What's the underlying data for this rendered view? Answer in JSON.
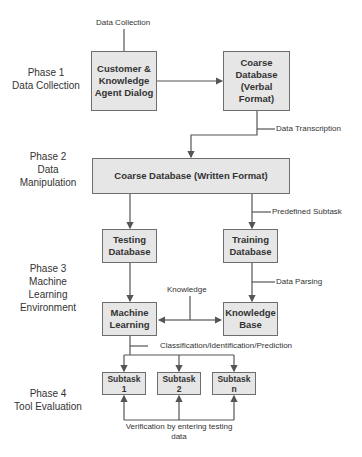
{
  "phases": [
    {
      "id": "phase1",
      "label": "Phase 1\nData Collection"
    },
    {
      "id": "phase2",
      "label": "Phase 2\nData\nManipulation"
    },
    {
      "id": "phase3",
      "label": "Phase 3\nMachine\nLearning\nEnvironment"
    },
    {
      "id": "phase4",
      "label": "Phase 4\nTool Evaluation"
    }
  ],
  "boxes": {
    "dialog": "Customer &\nKnowledge\nAgent Dialog",
    "coarse_verbal": "Coarse\nDatabase\n(Verbal\nFormat)",
    "coarse_written": "Coarse Database (Written Format)",
    "testing_db": "Testing\nDatabase",
    "training_db": "Training\nDatabase",
    "machine_learning": "Machine\nLearning",
    "knowledge_base": "Knowledge\nBase",
    "subtask_1": "Subtask\n1",
    "subtask_2": "Subtask\n2",
    "subtask_n": "Subtask\nn"
  },
  "edge_labels": {
    "data_collection": "Data Collection",
    "data_transcription": "Data Transcription",
    "predefined_subtask": "Predefined Subtask",
    "data_parsing": "Data Parsing",
    "knowledge": "Knowledge",
    "classification": "Classification/Identification/Prediction",
    "verification": "Verification by entering testing\ndata"
  },
  "colors": {
    "box_fill": "#e6e6e6",
    "box_border": "#6e6e6e",
    "line": "#555555"
  }
}
